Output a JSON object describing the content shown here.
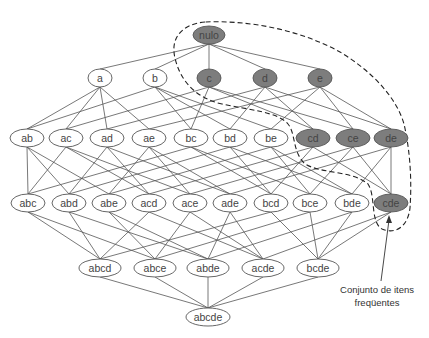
{
  "colors": {
    "frequent_fill": "#7d7d7d",
    "plain_fill": "#ffffff",
    "stroke": "#555555",
    "boundary": "#222222"
  },
  "caption": {
    "line1": "Conjunto de itens",
    "line2": "freqüentes"
  },
  "levels": [
    {
      "y": 35,
      "rx": 12,
      "nodes": [
        {
          "id": "nulo",
          "label": "nulo",
          "x": 209,
          "frequent": true
        }
      ]
    },
    {
      "y": 78,
      "rx": 12,
      "nodes": [
        {
          "id": "a",
          "label": "a",
          "x": 100,
          "frequent": false
        },
        {
          "id": "b",
          "label": "b",
          "x": 155,
          "frequent": false
        },
        {
          "id": "c",
          "label": "c",
          "x": 209,
          "frequent": true
        },
        {
          "id": "d",
          "label": "d",
          "x": 265,
          "frequent": true
        },
        {
          "id": "e",
          "label": "e",
          "x": 320,
          "frequent": true
        }
      ]
    },
    {
      "y": 138,
      "rx": 13,
      "nodes": [
        {
          "id": "ab",
          "label": "ab",
          "x": 27,
          "frequent": false
        },
        {
          "id": "ac",
          "label": "ac",
          "x": 66,
          "frequent": false
        },
        {
          "id": "ad",
          "label": "ad",
          "x": 107,
          "frequent": false
        },
        {
          "id": "ae",
          "label": "ae",
          "x": 149,
          "frequent": false
        },
        {
          "id": "bc",
          "label": "bc",
          "x": 191,
          "frequent": false
        },
        {
          "id": "bd",
          "label": "bd",
          "x": 230,
          "frequent": false
        },
        {
          "id": "be",
          "label": "be",
          "x": 271,
          "frequent": false
        },
        {
          "id": "cd",
          "label": "cd",
          "x": 313,
          "frequent": true
        },
        {
          "id": "ce",
          "label": "ce",
          "x": 353,
          "frequent": true
        },
        {
          "id": "de",
          "label": "de",
          "x": 391,
          "frequent": true
        }
      ]
    },
    {
      "y": 203,
      "rx": 13,
      "nodes": [
        {
          "id": "abc",
          "label": "abc",
          "x": 28,
          "frequent": false
        },
        {
          "id": "abd",
          "label": "abd",
          "x": 69,
          "frequent": false
        },
        {
          "id": "abe",
          "label": "abe",
          "x": 109,
          "frequent": false
        },
        {
          "id": "acd",
          "label": "acd",
          "x": 149,
          "frequent": false
        },
        {
          "id": "ace",
          "label": "ace",
          "x": 190,
          "frequent": false
        },
        {
          "id": "ade",
          "label": "ade",
          "x": 230,
          "frequent": false
        },
        {
          "id": "bcd",
          "label": "bcd",
          "x": 271,
          "frequent": false
        },
        {
          "id": "bce",
          "label": "bce",
          "x": 310,
          "frequent": false
        },
        {
          "id": "bde",
          "label": "bde",
          "x": 352,
          "frequent": false
        },
        {
          "id": "cde",
          "label": "cde",
          "x": 391,
          "frequent": true
        }
      ]
    },
    {
      "y": 268,
      "rx": 17,
      "nodes": [
        {
          "id": "abcd",
          "label": "abcd",
          "x": 100,
          "frequent": false
        },
        {
          "id": "abce",
          "label": "abce",
          "x": 155,
          "frequent": false
        },
        {
          "id": "abde",
          "label": "abde",
          "x": 208,
          "frequent": false
        },
        {
          "id": "acde",
          "label": "acde",
          "x": 263,
          "frequent": false
        },
        {
          "id": "bcde",
          "label": "bcde",
          "x": 318,
          "frequent": false
        }
      ]
    },
    {
      "y": 317,
      "rx": 18,
      "nodes": [
        {
          "id": "abcde",
          "label": "abcde",
          "x": 208,
          "frequent": false
        }
      ]
    }
  ]
}
